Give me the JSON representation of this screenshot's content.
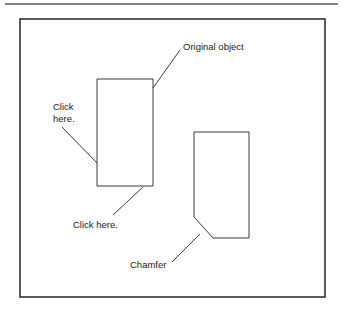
{
  "figure": {
    "kind": "technical-cad-illustration",
    "background_color": "#ffffff",
    "line_color": "#3a3a3a",
    "text_color": "#1a1a1a",
    "top_rule": {
      "x1": 5,
      "y1": 4,
      "x2": 338,
      "y2": 4
    },
    "frame": {
      "x": 20,
      "y": 19,
      "width": 305,
      "height": 278
    }
  },
  "shapes": {
    "original_object": {
      "name": "original-rectangle",
      "points": "97,79 153,79 153,186 97,186"
    },
    "chamfered_object": {
      "name": "chamfered-rectangle",
      "points": "194,132 249,132 249,238 213,238 194,217"
    }
  },
  "labels": {
    "original_object": {
      "text": "Original object",
      "x": 183,
      "y": 50
    },
    "click_here_left_line1": {
      "text": "Click",
      "x": 53,
      "y": 110
    },
    "click_here_left_line2": {
      "text": "here.",
      "x": 53,
      "y": 122
    },
    "click_here_bottom": {
      "text": "Click here.",
      "x": 73,
      "y": 228
    },
    "chamfer": {
      "text": "Chamfer",
      "x": 130,
      "y": 268
    }
  },
  "leader_lines": {
    "original_object": {
      "x1": 180,
      "y1": 50,
      "x2": 153,
      "y2": 88
    },
    "click_here_left": {
      "x1": 62,
      "y1": 127,
      "x2": 97,
      "y2": 163
    },
    "click_here_bottom": {
      "x1": 113,
      "y1": 215,
      "x2": 143,
      "y2": 187
    },
    "chamfer": {
      "x1": 172,
      "y1": 262,
      "x2": 200,
      "y2": 234
    }
  }
}
